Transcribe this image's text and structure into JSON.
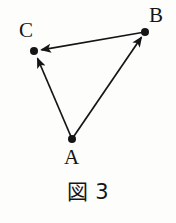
{
  "figure": {
    "caption_kanji": "図",
    "caption_number": "3",
    "background_color": "#fdfdfc",
    "stroke_color": "#151515"
  },
  "diagram": {
    "type": "vector-triangle",
    "vertices": [
      {
        "id": "A",
        "label": "A",
        "x": 72,
        "y": 139,
        "dot_radius": 4
      },
      {
        "id": "B",
        "label": "B",
        "x": 145,
        "y": 32,
        "dot_radius": 4
      },
      {
        "id": "C",
        "label": "C",
        "x": 34,
        "y": 51,
        "dot_radius": 4
      }
    ],
    "arrows": [
      {
        "id": "AC",
        "from": "A",
        "to": "C",
        "arrowhead_at": "C"
      },
      {
        "id": "AB",
        "from": "A",
        "to": "B",
        "arrowhead_at": "B"
      },
      {
        "id": "BC",
        "from": "B",
        "to": "C",
        "arrowhead_at": "C"
      }
    ]
  }
}
